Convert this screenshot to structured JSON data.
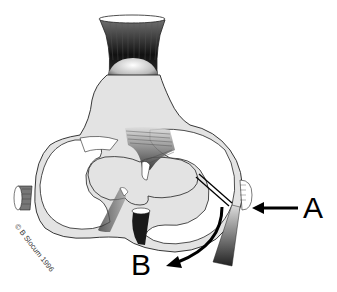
{
  "diagram": {
    "labels": {
      "a": "A",
      "b": "B"
    },
    "copyright": "© B Slocum 1996",
    "arrows": [
      {
        "name": "arrow-a",
        "direction": "left",
        "points_to": "lateral collateral ligament region"
      },
      {
        "name": "arrow-b",
        "direction": "curved down-left",
        "points_to": "meniscus rotation"
      }
    ],
    "colors": {
      "background": "#ffffff",
      "bone_fill": "#e3e3e3",
      "meniscus_fill": "#ffffff",
      "outline": "#222222",
      "ligament_dark": "#2a2a2a",
      "arrow": "#000000"
    }
  }
}
